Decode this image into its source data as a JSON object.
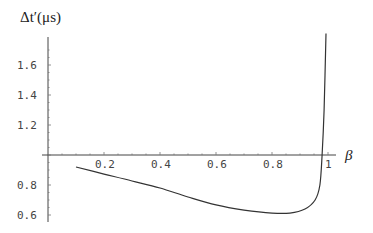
{
  "chart_data": {
    "type": "line",
    "title": "",
    "xlabel": "β",
    "ylabel": "Δt′(μs)",
    "xlim": [
      0,
      1.03
    ],
    "ylim": [
      0.55,
      1.78
    ],
    "axes_origin": {
      "x": 0,
      "y": 1.0
    },
    "grid": false,
    "legend": null,
    "x_ticks": [
      0.2,
      0.4,
      0.6,
      0.8,
      1
    ],
    "x_tick_labels": [
      "0.2",
      "0.4",
      "0.6",
      "0.8",
      "1"
    ],
    "y_ticks": [
      0.6,
      0.8,
      1.2,
      1.4,
      1.6
    ],
    "y_tick_labels": [
      "0.6",
      "0.8",
      "1.2",
      "1.4",
      "1.6"
    ],
    "series": [
      {
        "name": "Δt′(β)",
        "x": [
          0.1,
          0.2,
          0.3,
          0.4,
          0.5,
          0.6,
          0.7,
          0.8,
          0.864,
          0.918,
          0.954,
          0.971,
          0.979,
          0.986,
          0.993
        ],
        "y": [
          0.92,
          0.873,
          0.827,
          0.78,
          0.72,
          0.667,
          0.633,
          0.613,
          0.613,
          0.64,
          0.7,
          0.8,
          1.0,
          1.3,
          1.81
        ]
      }
    ]
  },
  "labels": {
    "y_axis_title": "Δt′(μs)",
    "x_axis_title": "β"
  }
}
